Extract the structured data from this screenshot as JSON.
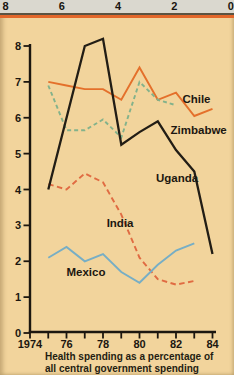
{
  "figure": {
    "top_scale": {
      "labels": [
        "8",
        "6",
        "4",
        "2",
        "0"
      ]
    },
    "caption_line1": "Health spending as a percentage of",
    "caption_line2": "all central government spending",
    "colors": {
      "background": "#f2d49c",
      "top_bar": "#dad8cf",
      "rule_dark": "#5b5342",
      "rule_orange": "#e2672a"
    }
  },
  "chart_data": {
    "type": "line",
    "title": "Health spending as a percentage of all central government spending",
    "xlabel": "Year",
    "ylabel": "Percent of central government spending",
    "xlim": [
      1974,
      1984
    ],
    "ylim": [
      0,
      8
    ],
    "grid": false,
    "legend_position": "inline-labels",
    "axis_color": "#1c1710",
    "text_color": "#1c1710",
    "y_ticks": [
      0,
      1,
      2,
      3,
      4,
      5,
      6,
      7,
      8
    ],
    "x_ticks": [
      {
        "year": 1974,
        "label": "1974"
      },
      {
        "year": 1975,
        "label": ""
      },
      {
        "year": 1976,
        "label": "76"
      },
      {
        "year": 1977,
        "label": ""
      },
      {
        "year": 1978,
        "label": "78"
      },
      {
        "year": 1979,
        "label": ""
      },
      {
        "year": 1980,
        "label": "80"
      },
      {
        "year": 1981,
        "label": ""
      },
      {
        "year": 1982,
        "label": "82"
      },
      {
        "year": 1983,
        "label": ""
      },
      {
        "year": 1984,
        "label": "84"
      }
    ],
    "series": [
      {
        "name": "Chile",
        "color": "#e4702b",
        "width": 1.9,
        "dash": "",
        "points": [
          [
            1975,
            7.0
          ],
          [
            1976,
            6.9
          ],
          [
            1977,
            6.8
          ],
          [
            1978,
            6.8
          ],
          [
            1979,
            6.5
          ],
          [
            1980,
            7.4
          ],
          [
            1981,
            6.5
          ],
          [
            1982,
            6.7
          ],
          [
            1983,
            6.05
          ],
          [
            1984,
            6.25
          ]
        ],
        "label": {
          "year": 1982.35,
          "value": 6.42
        }
      },
      {
        "name": "Zimbabwe",
        "color": "#83b28b",
        "width": 1.9,
        "dash": "4 3",
        "points": [
          [
            1975,
            6.9
          ],
          [
            1976,
            5.65
          ],
          [
            1977,
            5.65
          ],
          [
            1978,
            5.95
          ],
          [
            1979,
            5.45
          ],
          [
            1980,
            7.0
          ],
          [
            1981,
            6.5
          ],
          [
            1982,
            6.35
          ]
        ],
        "label": {
          "year": 1981.7,
          "value": 5.55
        }
      },
      {
        "name": "India",
        "color": "#e06b42",
        "width": 1.9,
        "dash": "5.5 3.5",
        "points": [
          [
            1975,
            4.15
          ],
          [
            1976,
            4.0
          ],
          [
            1977,
            4.45
          ],
          [
            1978,
            4.2
          ],
          [
            1979,
            3.3
          ],
          [
            1980,
            2.1
          ],
          [
            1981,
            1.5
          ],
          [
            1982,
            1.35
          ],
          [
            1983,
            1.45
          ]
        ],
        "label": {
          "year": 1978.2,
          "value": 2.95
        }
      },
      {
        "name": "Mexico",
        "color": "#77aec5",
        "width": 1.9,
        "dash": "",
        "points": [
          [
            1975,
            2.1
          ],
          [
            1976,
            2.4
          ],
          [
            1977,
            2.0
          ],
          [
            1978,
            2.2
          ],
          [
            1979,
            1.7
          ],
          [
            1980,
            1.4
          ],
          [
            1981,
            1.9
          ],
          [
            1982,
            2.3
          ],
          [
            1983,
            2.5
          ]
        ],
        "label": {
          "year": 1976.0,
          "value": 1.6
        }
      },
      {
        "name": "Uganda",
        "color": "#221d15",
        "width": 2.3,
        "dash": "",
        "points": [
          [
            1975,
            4.0
          ],
          [
            1977,
            8.0
          ],
          [
            1978,
            8.2
          ],
          [
            1979,
            5.25
          ],
          [
            1980,
            5.6
          ],
          [
            1981,
            5.9
          ],
          [
            1982,
            5.1
          ],
          [
            1983,
            4.5
          ],
          [
            1984,
            2.2
          ]
        ],
        "label": {
          "year": 1980.9,
          "value": 4.2
        }
      }
    ]
  }
}
